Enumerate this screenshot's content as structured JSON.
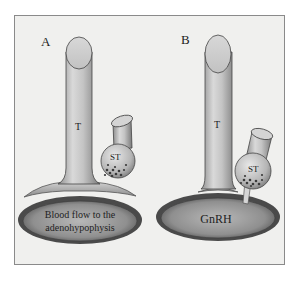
{
  "figure": {
    "panels": [
      {
        "label": "A",
        "tube_label": "T",
        "terminal_label": "ST",
        "target_text_line1": "Blood flow to the",
        "target_text_line2": "adenohypophysis"
      },
      {
        "label": "B",
        "tube_label": "T",
        "terminal_label": "ST",
        "target_text_line1": "GnRH"
      }
    ],
    "colors": {
      "background": "#f0f0ee",
      "border": "#8a8a8a",
      "tube_light": "#e6e6e6",
      "tube_dark": "#8c8c8c",
      "ellipse_dark": "#5a5a5a",
      "ellipse_light": "#a8a8a8",
      "granules": "#3a3a3a"
    }
  }
}
